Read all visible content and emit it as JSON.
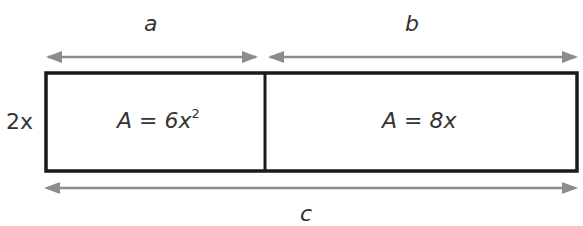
{
  "diagram": {
    "dimension_labels": {
      "top_left": "a",
      "top_right": "b",
      "bottom": "c",
      "height": "2x"
    },
    "regions": [
      {
        "name": "left",
        "area_prefix": "A = 6x",
        "area_exponent": "2"
      },
      {
        "name": "right",
        "area_prefix": "A = 8x",
        "area_exponent": ""
      }
    ],
    "colors": {
      "outline": "#1a1a1a",
      "arrow": "#8c8c8c",
      "text": "#333333"
    }
  }
}
